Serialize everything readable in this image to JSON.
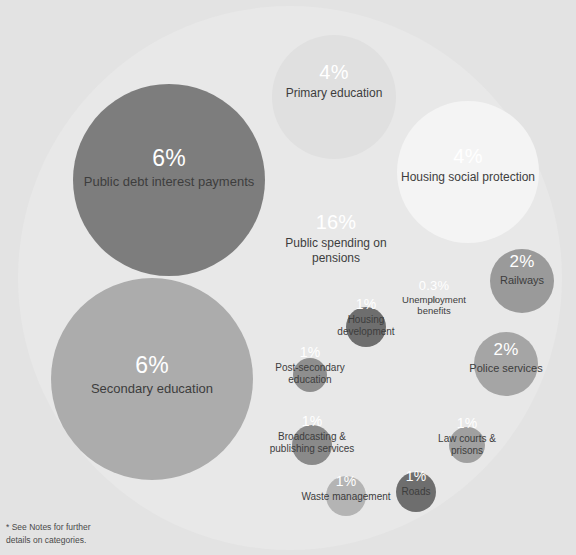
{
  "chart_data": {
    "type": "bubble",
    "title": "",
    "subtitle": "",
    "xlabel": "",
    "ylabel": "",
    "legend_position": "none",
    "grid": false,
    "value_unit": "percent",
    "background_color": "#e3e3e3",
    "container": {
      "id": "pensions",
      "label": "Public spending on pensions",
      "value": 16,
      "value_label": "16%",
      "color": "#e8e8e8",
      "cx": 290,
      "cy": 278,
      "r": 272,
      "label_cx": 336,
      "label_cy": 238,
      "pct_color": "#ffffff",
      "name_color": "#3d3d3d"
    },
    "bubbles": [
      {
        "id": "public-debt-interest-payments",
        "label": "Public debt interest payments",
        "value": 6,
        "value_label": "6%",
        "color": "#7d7d7d",
        "cx": 169,
        "cy": 180,
        "r": 96,
        "label_cx": 169,
        "label_cy": 167,
        "pct_color": "#ffffff",
        "name_color": "#3d3d3d"
      },
      {
        "id": "primary-education",
        "label": "Primary education",
        "value": 4,
        "value_label": "4%",
        "color": "#e0e0e0",
        "cx": 334,
        "cy": 97,
        "r": 62,
        "label_cx": 334,
        "label_cy": 81,
        "pct_color": "#ffffff",
        "name_color": "#3d3d3d"
      },
      {
        "id": "housing-social-protection",
        "label": "Housing social protection",
        "value": 4,
        "value_label": "4%",
        "color": "#f4f4f4",
        "cx": 468,
        "cy": 172,
        "r": 71,
        "label_cx": 468,
        "label_cy": 165,
        "pct_color": "#ffffff",
        "name_color": "#3d3d3d"
      },
      {
        "id": "secondary-education",
        "label": "Secondary education",
        "value": 6,
        "value_label": "6%",
        "color": "#acacac",
        "cx": 152,
        "cy": 379,
        "r": 101,
        "label_cx": 152,
        "label_cy": 374,
        "pct_color": "#ffffff",
        "name_color": "#3d3d3d"
      },
      {
        "id": "railways",
        "label": "Railways",
        "value": 2,
        "value_label": "2%",
        "color": "#9a9a9a",
        "cx": 522,
        "cy": 281,
        "r": 32,
        "label_cx": 522,
        "label_cy": 270,
        "pct_color": "#ffffff",
        "name_color": "#3d3d3d"
      },
      {
        "id": "police-services",
        "label": "Police services",
        "value": 2,
        "value_label": "2%",
        "color": "#a5a5a5",
        "cx": 506,
        "cy": 364,
        "r": 32,
        "label_cx": 506,
        "label_cy": 358,
        "pct_color": "#ffffff",
        "name_color": "#3d3d3d"
      },
      {
        "id": "housing-development",
        "label": "Housing development",
        "value": 1,
        "value_label": "1%",
        "color": "#6e6e6e",
        "cx": 366,
        "cy": 327,
        "r": 20,
        "label_cx": 366,
        "label_cy": 317,
        "pct_color": "#ffffff",
        "name_color": "#3d3d3d"
      },
      {
        "id": "post-secondary-education",
        "label": "Post-secondary education",
        "value": 1,
        "value_label": "1%",
        "color": "#8e8e8e",
        "cx": 310,
        "cy": 375,
        "r": 17,
        "label_cx": 310,
        "label_cy": 365,
        "pct_color": "#ffffff",
        "name_color": "#3d3d3d"
      },
      {
        "id": "broadcasting-publishing-services",
        "label": "Broadcasting & publishing services",
        "value": 1,
        "value_label": "1%",
        "color": "#8a8a8a",
        "cx": 312,
        "cy": 445,
        "r": 20,
        "label_cx": 312,
        "label_cy": 434,
        "pct_color": "#ffffff",
        "name_color": "#3d3d3d"
      },
      {
        "id": "law-courts-prisons",
        "label": "Law courts & prisons",
        "value": 1,
        "value_label": "1%",
        "color": "#a0a0a0",
        "cx": 467,
        "cy": 445,
        "r": 18,
        "label_cx": 467,
        "label_cy": 436,
        "pct_color": "#ffffff",
        "name_color": "#3d3d3d"
      },
      {
        "id": "waste-management",
        "label": "Waste management",
        "value": 1,
        "value_label": "1%",
        "color": "#b4b4b4",
        "cx": 346,
        "cy": 496,
        "r": 20,
        "label_cx": 346,
        "label_cy": 488,
        "pct_color": "#ffffff",
        "name_color": "#3d3d3d"
      },
      {
        "id": "roads",
        "label": "Roads",
        "value": 1,
        "value_label": "1%",
        "color": "#6e6e6e",
        "cx": 416,
        "cy": 492,
        "r": 20,
        "label_cx": 416,
        "label_cy": 483,
        "pct_color": "#ffffff",
        "name_color": "#3d3d3d"
      },
      {
        "id": "unemployment-benefits",
        "label": "Unemployment benefits",
        "value": 0.3,
        "value_label": "0.3%",
        "color": "#c9c9c9",
        "cx": 434,
        "cy": 300,
        "r": 3,
        "label_cx": 434,
        "label_cy": 298,
        "pct_color": "#ffffff",
        "name_color": "#3d3d3d"
      }
    ]
  },
  "footnote": {
    "line1": "* See Notes for further",
    "line2": "details on categories."
  }
}
